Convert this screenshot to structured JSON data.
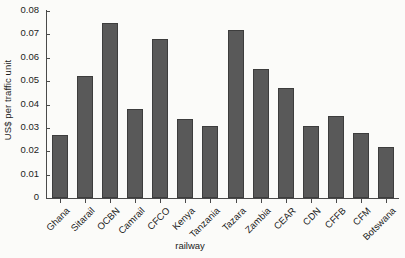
{
  "chart_data": {
    "type": "bar",
    "title": "",
    "subtitle": "",
    "xlabel": "railway",
    "ylabel": "US$ per traffic unit",
    "categories": [
      "Ghana",
      "Sitarail",
      "OCBN",
      "Camrail",
      "CFCO",
      "Kenya",
      "Tanzania",
      "Tazara",
      "Zambia",
      "CEAR",
      "CDN",
      "CFFB",
      "CFM",
      "Botswana"
    ],
    "values": [
      0.027,
      0.052,
      0.075,
      0.038,
      0.068,
      0.034,
      0.031,
      0.072,
      0.055,
      0.047,
      0.031,
      0.035,
      0.028,
      0.022
    ],
    "series": [
      {
        "name": "US$ per traffic unit",
        "values": [
          0.027,
          0.052,
          0.075,
          0.038,
          0.068,
          0.034,
          0.031,
          0.072,
          0.055,
          0.047,
          0.031,
          0.035,
          0.028,
          0.022
        ]
      }
    ],
    "ylim": [
      0,
      0.08
    ],
    "yticks": [
      0,
      0.01,
      0.02,
      0.03,
      0.04,
      0.05,
      0.06,
      0.07,
      0.08
    ],
    "ytick_labels": [
      "0",
      "0.01",
      "0.02",
      "0.03",
      "0.04",
      "0.05",
      "0.06",
      "0.07",
      "0.08"
    ],
    "grid": false,
    "legend": null,
    "legend_position": "none",
    "bar_color": "#595959",
    "bar_edge_color": "#3d3d3d",
    "background_color": "#fbfbf9",
    "axis_color": "#4a4a4a",
    "xtick_rotation": 45
  }
}
